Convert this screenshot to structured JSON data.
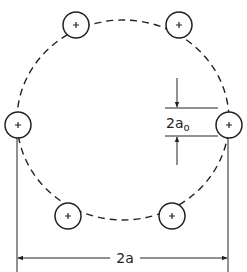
{
  "diagram": {
    "labels": {
      "spacing": "2a",
      "wire_diameter_main": "2a",
      "wire_diameter_sub": "o"
    },
    "colors": {
      "stroke": "#222222",
      "background": "#ffffff"
    },
    "wires": [
      {
        "name": "wire-top-left",
        "cx": 76,
        "cy": 25
      },
      {
        "name": "wire-top-right",
        "cx": 179,
        "cy": 25
      },
      {
        "name": "wire-left",
        "cx": 18,
        "cy": 125
      },
      {
        "name": "wire-right",
        "cx": 229,
        "cy": 125
      },
      {
        "name": "wire-bottom-left",
        "cx": 68,
        "cy": 216
      },
      {
        "name": "wire-bottom-right",
        "cx": 172,
        "cy": 216
      }
    ]
  }
}
